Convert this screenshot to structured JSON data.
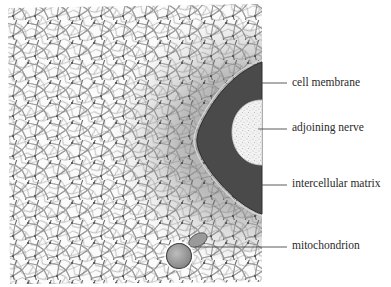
{
  "figure": {
    "type": "scientific illustration",
    "colors": {
      "background": "#ffffff",
      "network_line": "#6e6e6e",
      "network_fill": "#f4f4f4",
      "matrix_shade": "#a9a9a9",
      "membrane_dark": "#4a4a4a",
      "nerve_fill": "#efefef",
      "label_text": "#2a2a2a",
      "leader_line": "#4a4a4a"
    }
  },
  "labels": [
    {
      "id": "cell-membrane",
      "text": "cell membrane",
      "x": 292,
      "y": 83,
      "line_from_x": 240,
      "line_to_x": 287
    },
    {
      "id": "adjoining-nerve",
      "text": "adjoining nerve",
      "x": 292,
      "y": 128,
      "line_from_x": 258,
      "line_to_x": 287
    },
    {
      "id": "intercellular-matrix",
      "text": "intercellular matrix",
      "x": 292,
      "y": 184,
      "line_from_x": 250,
      "line_to_x": 287
    },
    {
      "id": "mitochondrion",
      "text": "mitochondrion",
      "x": 292,
      "y": 246,
      "line_from_x": 195,
      "line_to_x": 287
    }
  ]
}
